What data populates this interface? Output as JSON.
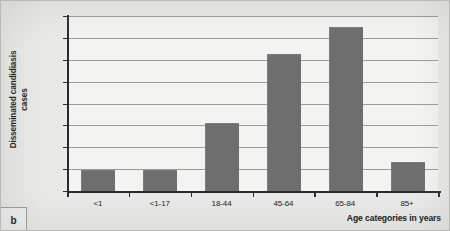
{
  "figure": {
    "panel_label": "b"
  },
  "chart_data": {
    "type": "bar",
    "title": "",
    "xlabel": "Age categories in years",
    "ylabel": "Disseminated candidiasis cases",
    "ylabel_line1": "Disseminated candidiasis",
    "ylabel_line2": "cases",
    "categories": [
      "<1",
      "<1-17",
      "18-44",
      "45-64",
      "65-84",
      "85+"
    ],
    "values": [
      4.6,
      4.6,
      15.3,
      31.0,
      37.2,
      6.5
    ],
    "value_labels": [
      "4.6%",
      "4.6%",
      "15.3%",
      "31.0%",
      "37.2%",
      "6.5%"
    ],
    "ylim": [
      0,
      40
    ],
    "ytick_values": [
      0,
      5,
      10,
      15,
      20,
      25,
      30,
      35,
      40
    ],
    "ytick_labels": [
      "0.0%",
      "5.0%",
      "10.0%",
      "15.0%",
      "20.0%",
      "25.0%",
      "30.0%",
      "35.0%",
      "40.0%"
    ],
    "grid": true,
    "legend": "none",
    "bar_color": "#6e6e6e",
    "plot_background": "#f3f3f1",
    "gridline_color": "#9a9a98",
    "axis_color": "#2b2b2b",
    "figure_background": "#e9e9e7"
  }
}
